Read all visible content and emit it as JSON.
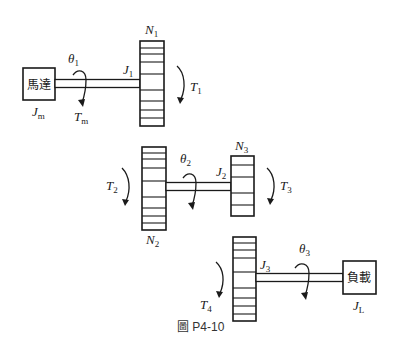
{
  "figure": {
    "caption": "圖 P4-10",
    "motor": {
      "label": "馬達",
      "inertia_symbol": "J",
      "inertia_sub": "m"
    },
    "load": {
      "label": "負載",
      "inertia_symbol": "J",
      "inertia_sub": "L"
    },
    "stage1": {
      "angle": {
        "symbol": "θ",
        "sub": "1"
      },
      "torque_motor": {
        "symbol": "T",
        "sub": "m"
      },
      "inertia": {
        "symbol": "J",
        "sub": "1"
      },
      "gear": {
        "symbol": "N",
        "sub": "1"
      },
      "torque_gear": {
        "symbol": "T",
        "sub": "1"
      }
    },
    "stage2": {
      "gear_in": {
        "symbol": "N",
        "sub": "2"
      },
      "torque_in": {
        "symbol": "T",
        "sub": "2"
      },
      "angle": {
        "symbol": "θ",
        "sub": "2"
      },
      "inertia": {
        "symbol": "J",
        "sub": "2"
      },
      "gear_out": {
        "symbol": "N",
        "sub": "3"
      },
      "torque_out": {
        "symbol": "T",
        "sub": "3"
      }
    },
    "stage3": {
      "torque_in": {
        "symbol": "T",
        "sub": "4"
      },
      "inertia": {
        "symbol": "J",
        "sub": "3"
      },
      "angle": {
        "symbol": "θ",
        "sub": "3"
      }
    }
  }
}
